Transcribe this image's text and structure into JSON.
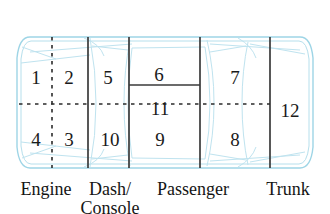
{
  "diagram": {
    "colors": {
      "car_outline": "#9ed5e6",
      "car_detail": "#bfe3ef",
      "divider": "#3a3a3a",
      "dashed": "#2b2b2b",
      "text": "#1a1a1a",
      "background": "#ffffff"
    },
    "zones": [
      {
        "id": "zone-1",
        "label": "1",
        "x": 36,
        "y": 77
      },
      {
        "id": "zone-2",
        "label": "2",
        "x": 69,
        "y": 77
      },
      {
        "id": "zone-5",
        "label": "5",
        "x": 108,
        "y": 77
      },
      {
        "id": "zone-6",
        "label": "6",
        "x": 159,
        "y": 74
      },
      {
        "id": "zone-7",
        "label": "7",
        "x": 235,
        "y": 77
      },
      {
        "id": "zone-11",
        "label": "11",
        "x": 160,
        "y": 108
      },
      {
        "id": "zone-12",
        "label": "12",
        "x": 290,
        "y": 110
      },
      {
        "id": "zone-4",
        "label": "4",
        "x": 36,
        "y": 139
      },
      {
        "id": "zone-3",
        "label": "3",
        "x": 69,
        "y": 139
      },
      {
        "id": "zone-10",
        "label": "10",
        "x": 110,
        "y": 139
      },
      {
        "id": "zone-9",
        "label": "9",
        "x": 160,
        "y": 139
      },
      {
        "id": "zone-8",
        "label": "8",
        "x": 235,
        "y": 139
      }
    ],
    "section_labels": [
      {
        "id": "label-engine",
        "text": "Engine",
        "x": 46,
        "y": 180
      },
      {
        "id": "label-dash",
        "text": "Dash/\nConsole",
        "x": 110,
        "y": 180
      },
      {
        "id": "label-passenger",
        "text": "Passenger",
        "x": 193,
        "y": 180
      },
      {
        "id": "label-trunk",
        "text": "Trunk",
        "x": 288,
        "y": 180
      }
    ]
  }
}
